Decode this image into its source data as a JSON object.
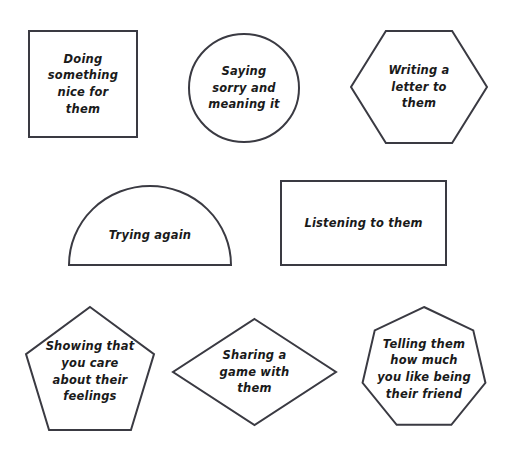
{
  "page": {
    "background_color": "#ffffff",
    "stroke_color": "#3a3a42",
    "text_color": "#1a1a1a",
    "width": 505,
    "height": 460
  },
  "shapes": [
    {
      "id": "square",
      "shape_name": "square",
      "text": "Doing\nsomething\nnice for\nthem",
      "x": 28,
      "y": 30,
      "w": 110,
      "h": 108
    },
    {
      "id": "circle",
      "shape_name": "circle",
      "text": "Saying\nsorry and\nmeaning it",
      "x": 188,
      "y": 33,
      "w": 112,
      "h": 110
    },
    {
      "id": "hexagon",
      "shape_name": "hexagon",
      "text": "Writing a\nletter to them",
      "x": 350,
      "y": 30,
      "w": 138,
      "h": 114
    },
    {
      "id": "semicircle",
      "shape_name": "semicircle",
      "text": "Trying again",
      "x": 68,
      "y": 185,
      "w": 164,
      "h": 81
    },
    {
      "id": "rectangle",
      "shape_name": "rectangle",
      "text": "Listening to them",
      "x": 280,
      "y": 180,
      "w": 167,
      "h": 86
    },
    {
      "id": "pentagon",
      "shape_name": "pentagon",
      "text": "Showing that\nyou care\nabout their\nfeelings",
      "x": 25,
      "y": 306,
      "w": 130,
      "h": 125
    },
    {
      "id": "diamond",
      "shape_name": "diamond",
      "text": "Sharing a\ngame with\nthem",
      "x": 172,
      "y": 318,
      "w": 165,
      "h": 108
    },
    {
      "id": "heptagon",
      "shape_name": "heptagon",
      "text": "Telling them\nhow much\nyou like being\ntheir friend",
      "x": 360,
      "y": 306,
      "w": 128,
      "h": 126
    }
  ]
}
